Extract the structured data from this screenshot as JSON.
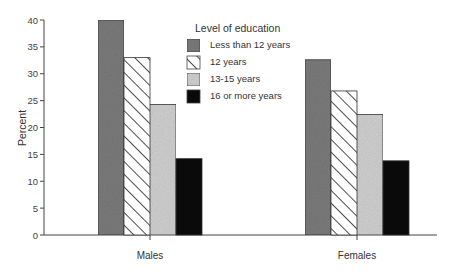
{
  "chart_data": {
    "type": "bar",
    "title": "",
    "xlabel": "",
    "ylabel": "Percent",
    "ylim": [
      0,
      40
    ],
    "yticks": [
      0,
      5,
      10,
      15,
      20,
      25,
      30,
      35,
      40
    ],
    "categories": [
      "Males",
      "Females"
    ],
    "legend_title": "Level of education",
    "legend_position": "top-center",
    "grid": false,
    "series": [
      {
        "name": "Less than 12 years",
        "values": [
          40.0,
          32.6
        ],
        "fill": "#7a7a7a",
        "pattern": "dark-stipple"
      },
      {
        "name": "12 years",
        "values": [
          33.0,
          26.8
        ],
        "fill": "#ffffff",
        "pattern": "diagonal-hatch"
      },
      {
        "name": "13-15 years",
        "values": [
          24.3,
          22.4
        ],
        "fill": "#cfcfcf",
        "pattern": "light-stipple"
      },
      {
        "name": "16 or more years",
        "values": [
          14.2,
          13.8
        ],
        "fill": "#0a0a0a",
        "pattern": "solid-black"
      }
    ]
  }
}
